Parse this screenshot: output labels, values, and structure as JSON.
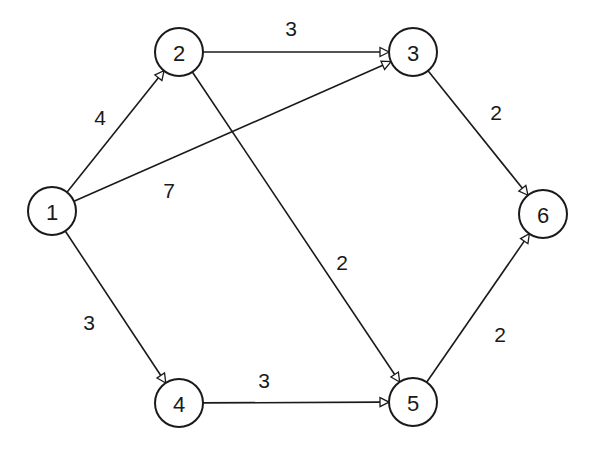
{
  "diagram": {
    "type": "directed-weighted-graph",
    "colors": {
      "stroke": "#1a1a1a",
      "background": "#ffffff"
    },
    "nodes": [
      {
        "id": "1",
        "label": "1",
        "x": 52,
        "y": 211
      },
      {
        "id": "2",
        "label": "2",
        "x": 179,
        "y": 52
      },
      {
        "id": "3",
        "label": "3",
        "x": 413,
        "y": 52
      },
      {
        "id": "4",
        "label": "4",
        "x": 179,
        "y": 403
      },
      {
        "id": "5",
        "label": "5",
        "x": 413,
        "y": 402
      },
      {
        "id": "6",
        "label": "6",
        "x": 543,
        "y": 214
      }
    ],
    "edges": [
      {
        "from": "1",
        "to": "2",
        "weight": "4",
        "label_x": 100,
        "label_y": 117
      },
      {
        "from": "1",
        "to": "3",
        "weight": "7",
        "label_x": 169,
        "label_y": 190
      },
      {
        "from": "1",
        "to": "4",
        "weight": "3",
        "label_x": 89,
        "label_y": 322
      },
      {
        "from": "2",
        "to": "3",
        "weight": "3",
        "label_x": 291,
        "label_y": 28
      },
      {
        "from": "2",
        "to": "5",
        "weight": "2",
        "label_x": 342,
        "label_y": 262
      },
      {
        "from": "3",
        "to": "6",
        "weight": "2",
        "label_x": 496,
        "label_y": 112
      },
      {
        "from": "4",
        "to": "5",
        "weight": "3",
        "label_x": 264,
        "label_y": 380
      },
      {
        "from": "5",
        "to": "6",
        "weight": "2",
        "label_x": 500,
        "label_y": 334
      }
    ],
    "node_radius": 24
  }
}
